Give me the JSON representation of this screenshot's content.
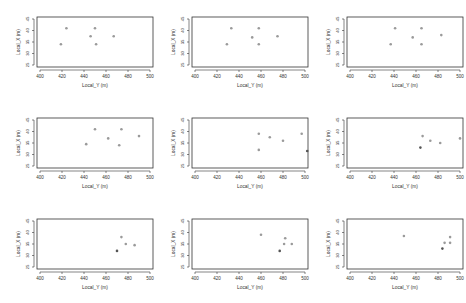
{
  "chart_data": [
    {
      "type": "scatter",
      "panel": "row1-col1",
      "xlabel": "Local_Y (m)",
      "ylabel": "Local_X (m)",
      "xlim": [
        400,
        500
      ],
      "ylim": [
        25,
        45
      ],
      "xticks": [
        400,
        420,
        440,
        460,
        480,
        500
      ],
      "yticks": [
        25,
        30,
        35,
        40,
        45
      ],
      "points": [
        [
          424,
          41
        ],
        [
          450,
          41
        ],
        [
          446,
          37.5
        ],
        [
          467,
          37.5
        ],
        [
          419,
          34
        ],
        [
          451,
          34
        ]
      ]
    },
    {
      "type": "scatter",
      "panel": "row1-col2",
      "xlabel": "Local_Y (m)",
      "ylabel": "Local_X (m)",
      "xlim": [
        400,
        500
      ],
      "ylim": [
        25,
        45
      ],
      "xticks": [
        400,
        420,
        440,
        460,
        480,
        500
      ],
      "yticks": [
        25,
        30,
        35,
        40,
        45
      ],
      "points": [
        [
          433,
          41
        ],
        [
          458,
          41
        ],
        [
          452,
          37
        ],
        [
          475,
          37.5
        ],
        [
          429,
          34
        ],
        [
          458,
          34
        ]
      ]
    },
    {
      "type": "scatter",
      "panel": "row1-col3",
      "xlabel": "Local_Y (m)",
      "ylabel": "Local_X (m)",
      "xlim": [
        400,
        500
      ],
      "ylim": [
        25,
        45
      ],
      "xticks": [
        400,
        420,
        440,
        460,
        480,
        500
      ],
      "yticks": [
        25,
        30,
        35,
        40,
        45
      ],
      "points": [
        [
          441,
          41
        ],
        [
          465,
          41
        ],
        [
          457,
          37
        ],
        [
          483,
          38
        ],
        [
          437,
          34
        ],
        [
          465,
          34
        ]
      ]
    },
    {
      "type": "scatter",
      "panel": "row2-col1",
      "xlabel": "Local_Y (m)",
      "ylabel": "Local_X (m)",
      "xlim": [
        400,
        500
      ],
      "ylim": [
        25,
        45
      ],
      "xticks": [
        400,
        420,
        440,
        460,
        480,
        500
      ],
      "yticks": [
        25,
        30,
        35,
        40,
        45
      ],
      "points": [
        [
          450,
          41
        ],
        [
          474,
          41
        ],
        [
          462,
          37
        ],
        [
          490,
          38
        ],
        [
          442,
          34.5
        ],
        [
          472,
          34
        ]
      ]
    },
    {
      "type": "scatter",
      "panel": "row2-col2",
      "xlabel": "Local_Y (m)",
      "ylabel": "Local_X (m)",
      "xlim": [
        400,
        500
      ],
      "ylim": [
        25,
        45
      ],
      "xticks": [
        400,
        420,
        440,
        460,
        480,
        500
      ],
      "yticks": [
        25,
        30,
        35,
        40,
        45
      ],
      "points": [
        [
          458,
          39
        ],
        [
          468,
          37.5
        ],
        [
          480,
          36
        ],
        [
          497,
          39
        ],
        [
          458,
          32
        ],
        [
          502,
          31.5
        ]
      ]
    },
    {
      "type": "scatter",
      "panel": "row2-col3",
      "xlabel": "Local_Y (m)",
      "ylabel": "Local_X (m)",
      "xlim": [
        400,
        500
      ],
      "ylim": [
        25,
        45
      ],
      "xticks": [
        400,
        420,
        440,
        460,
        480,
        500
      ],
      "yticks": [
        25,
        30,
        35,
        40,
        45
      ],
      "points": [
        [
          466,
          38
        ],
        [
          473,
          36
        ],
        [
          482,
          35
        ],
        [
          500,
          37
        ],
        [
          464,
          33
        ]
      ]
    },
    {
      "type": "scatter",
      "panel": "row3-col1",
      "xlabel": "Local_Y (m)",
      "ylabel": "Local_X (m)",
      "xlim": [
        400,
        500
      ],
      "ylim": [
        25,
        45
      ],
      "xticks": [
        400,
        420,
        440,
        460,
        480,
        500
      ],
      "yticks": [
        25,
        30,
        35,
        40,
        45
      ],
      "points": [
        [
          474,
          38
        ],
        [
          478,
          35
        ],
        [
          486,
          34.5
        ],
        [
          470,
          32
        ]
      ]
    },
    {
      "type": "scatter",
      "panel": "row3-col2",
      "xlabel": "Local_Y (m)",
      "ylabel": "Local_X (m)",
      "xlim": [
        400,
        500
      ],
      "ylim": [
        25,
        45
      ],
      "xticks": [
        400,
        420,
        440,
        460,
        480,
        500
      ],
      "yticks": [
        25,
        30,
        35,
        40,
        45
      ],
      "points": [
        [
          460,
          39
        ],
        [
          482,
          37.5
        ],
        [
          481,
          35
        ],
        [
          488,
          35
        ],
        [
          477,
          32
        ]
      ]
    },
    {
      "type": "scatter",
      "panel": "row3-col3",
      "xlabel": "Local_Y (m)",
      "ylabel": "Local_X (m)",
      "xlim": [
        400,
        500
      ],
      "ylim": [
        25,
        45
      ],
      "xticks": [
        400,
        420,
        440,
        460,
        480,
        500
      ],
      "yticks": [
        25,
        30,
        35,
        40,
        45
      ],
      "points": [
        [
          449,
          38.5
        ],
        [
          491,
          38
        ],
        [
          486,
          35.5
        ],
        [
          491,
          35.5
        ],
        [
          484,
          33
        ]
      ]
    }
  ],
  "style": {
    "point_color": "#9a9a9a",
    "dark_point_color": "#555555",
    "axis_color": "#333333",
    "text_color": "#333333"
  }
}
